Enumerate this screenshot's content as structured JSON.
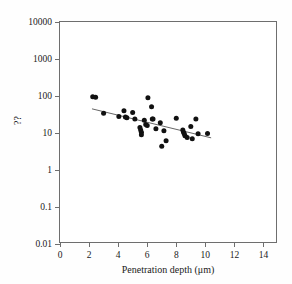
{
  "chart_data": {
    "type": "scatter",
    "title": "",
    "xlabel": "Penetration depth (μm)",
    "ylabel": "??",
    "xlim": [
      0,
      15
    ],
    "ylim": [
      0.01,
      10000
    ],
    "yscale": "log",
    "xscale": "linear",
    "grid": false,
    "legend": null,
    "xticks": [
      0,
      2,
      4,
      6,
      8,
      10,
      12,
      14
    ],
    "xtick_labels": [
      "0",
      "2",
      "4",
      "6",
      "8",
      "10",
      "12",
      "14"
    ],
    "yticks": [
      0.01,
      0.1,
      1,
      10,
      100,
      1000,
      10000
    ],
    "ytick_labels": [
      "0.01",
      "0.1",
      "1",
      "10",
      "100",
      "1000",
      "10000"
    ],
    "marker": "filled-circle",
    "marker_color": "#111111",
    "points": [
      {
        "x": 2.25,
        "y": 95
      },
      {
        "x": 2.45,
        "y": 93
      },
      {
        "x": 3.0,
        "y": 34
      },
      {
        "x": 4.05,
        "y": 28
      },
      {
        "x": 4.4,
        "y": 40
      },
      {
        "x": 4.5,
        "y": 27
      },
      {
        "x": 4.6,
        "y": 26
      },
      {
        "x": 5.0,
        "y": 36
      },
      {
        "x": 5.15,
        "y": 24
      },
      {
        "x": 5.5,
        "y": 14
      },
      {
        "x": 5.55,
        "y": 12
      },
      {
        "x": 5.6,
        "y": 10.5
      },
      {
        "x": 5.6,
        "y": 9.0
      },
      {
        "x": 5.8,
        "y": 22
      },
      {
        "x": 5.9,
        "y": 17
      },
      {
        "x": 6.0,
        "y": 16
      },
      {
        "x": 6.05,
        "y": 90
      },
      {
        "x": 6.3,
        "y": 51
      },
      {
        "x": 6.35,
        "y": 24
      },
      {
        "x": 6.4,
        "y": 24
      },
      {
        "x": 6.6,
        "y": 13
      },
      {
        "x": 6.9,
        "y": 19
      },
      {
        "x": 7.0,
        "y": 4.4
      },
      {
        "x": 7.15,
        "y": 11.5
      },
      {
        "x": 7.3,
        "y": 6.2
      },
      {
        "x": 8.0,
        "y": 25
      },
      {
        "x": 8.45,
        "y": 12
      },
      {
        "x": 8.5,
        "y": 10.5
      },
      {
        "x": 8.55,
        "y": 9.5
      },
      {
        "x": 8.6,
        "y": 8.4
      },
      {
        "x": 8.75,
        "y": 7.6
      },
      {
        "x": 9.0,
        "y": 15
      },
      {
        "x": 9.1,
        "y": 7.0
      },
      {
        "x": 9.35,
        "y": 24
      },
      {
        "x": 9.5,
        "y": 9.5
      },
      {
        "x": 10.15,
        "y": 9.7
      }
    ],
    "fit_line": {
      "style": "solid",
      "color": "#555555",
      "x_start": 2.2,
      "y_start": 45,
      "x_end": 10.4,
      "y_end": 7.4
    }
  }
}
